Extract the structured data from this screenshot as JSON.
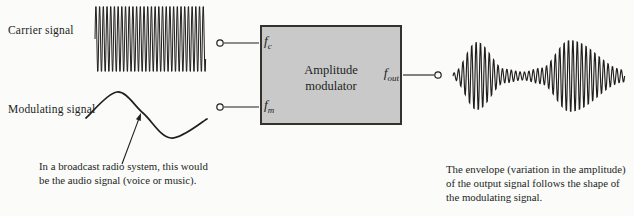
{
  "figure": {
    "carrier_label": "Carrier signal",
    "modulating_label": "Modulating signal",
    "modulator": {
      "line1": "Amplitude",
      "line2": "modulator"
    },
    "ports": {
      "fc": {
        "base": "f",
        "sub": "c"
      },
      "fm": {
        "base": "f",
        "sub": "m"
      },
      "fout": {
        "base": "f",
        "sub": "out"
      }
    },
    "caption_left_lines": [
      "In a broadcast radio system, this would",
      "be the audio signal (voice or music)."
    ],
    "caption_right_lines": [
      "The envelope (variation in the amplitude)",
      "of the output signal follows the shape of",
      "the modulating signal."
    ]
  },
  "colors": {
    "ink": "#211f1d",
    "box_fill": "#c9c9c9",
    "box_border": "#35312e",
    "background": "#fbfbf9"
  },
  "waveforms": {
    "carrier": {
      "x_start": 95,
      "x_end": 206,
      "center_y": 39,
      "amplitude": 34,
      "period": 3.7,
      "stroke": 1.0
    },
    "modulating": {
      "points": [
        [
          86,
          118
        ],
        [
          117,
          92
        ],
        [
          143,
          113
        ],
        [
          171,
          138
        ],
        [
          207,
          119
        ]
      ],
      "stroke": 1.7
    },
    "am_output": {
      "x_start": 453,
      "x_end": 625,
      "center_y": 76,
      "period": 4.4,
      "stroke": 1.15,
      "envelope": [
        [
          453,
          3
        ],
        [
          477,
          35
        ],
        [
          505,
          7
        ],
        [
          523,
          4
        ],
        [
          541,
          8
        ],
        [
          570,
          37
        ],
        [
          625,
          6
        ]
      ]
    }
  },
  "diagram": {
    "wires": [
      [
        224,
        43,
        259,
        43
      ],
      [
        224,
        107,
        259,
        107
      ],
      [
        403,
        75,
        434,
        75
      ]
    ],
    "terminals": [
      [
        220,
        43
      ],
      [
        220,
        107
      ],
      [
        438,
        75
      ]
    ],
    "terminal_radius": 3.2,
    "arrow": {
      "from": [
        122,
        164
      ],
      "to": [
        141,
        113
      ]
    }
  }
}
